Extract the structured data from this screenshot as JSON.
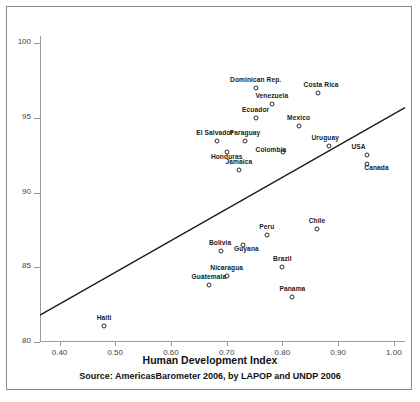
{
  "chart_data": {
    "type": "scatter",
    "title": "",
    "xlabel": "Human Development Index",
    "ylabel": "",
    "xlim": [
      0.365,
      1.02
    ],
    "ylim": [
      80,
      100.5
    ],
    "grid": false,
    "legend": "none",
    "source_note": "Source: AmericasBarometer 2006, by LAPOP and UNDP 2006",
    "x_ticks": [
      "0.40",
      "0.50",
      "0.60",
      "0.70",
      "0.80",
      "0.90",
      "1.00"
    ],
    "x_tick_values": [
      0.4,
      0.5,
      0.6,
      0.7,
      0.8,
      0.9,
      1.0
    ],
    "y_ticks": [
      "80",
      "85",
      "90",
      "95",
      "100"
    ],
    "y_tick_values": [
      80,
      85,
      90,
      95,
      100
    ],
    "fit_line": {
      "x": [
        0.365,
        1.02
      ],
      "y": [
        81.8,
        95.7
      ]
    },
    "points": [
      {
        "label": "Dominican Rep.",
        "x": 0.752,
        "y": 97.0,
        "label_dx": 0,
        "label_dy": -9
      },
      {
        "label": "Costa Rica",
        "x": 0.864,
        "y": 96.7,
        "label_dx": 3,
        "label_dy": -9
      },
      {
        "label": "Venezuela",
        "x": 0.781,
        "y": 95.95,
        "label_dx": 0,
        "label_dy": -9
      },
      {
        "label": "Ecuador",
        "x": 0.752,
        "y": 95.0,
        "label_dx": 0,
        "label_dy": -9
      },
      {
        "label": "Mexico",
        "x": 0.829,
        "y": 94.45,
        "label_dx": 0,
        "label_dy": -9
      },
      {
        "label": "El Salvador",
        "x": 0.682,
        "y": 93.45,
        "label_dx": -2,
        "label_dy": -9
      },
      {
        "label": "Paraguay",
        "x": 0.733,
        "y": 93.45,
        "label_dx": 0,
        "label_dy": -9
      },
      {
        "label": "Uruguay",
        "x": 0.884,
        "y": 93.15,
        "label_dx": -4,
        "label_dy": -9
      },
      {
        "label": "Honduras",
        "x": 0.7,
        "y": 92.75,
        "label_dx": 0,
        "label_dy": 4
      },
      {
        "label": "Colombia",
        "x": 0.801,
        "y": 92.7,
        "label_dx": -12,
        "label_dy": -3
      },
      {
        "label": "USA",
        "x": 0.951,
        "y": 92.55,
        "label_dx": -8,
        "label_dy": -9
      },
      {
        "label": "Canada",
        "x": 0.951,
        "y": 91.95,
        "label_dx": 10,
        "label_dy": 3
      },
      {
        "label": "Jamaica",
        "x": 0.722,
        "y": 91.55,
        "label_dx": 0,
        "label_dy": -9
      },
      {
        "label": "Chile",
        "x": 0.862,
        "y": 87.55,
        "label_dx": 0,
        "label_dy": -9
      },
      {
        "label": "Peru",
        "x": 0.772,
        "y": 87.15,
        "label_dx": 0,
        "label_dy": -9
      },
      {
        "label": "Guyana",
        "x": 0.73,
        "y": 86.5,
        "label_dx": 3,
        "label_dy": 3
      },
      {
        "label": "Bolivia",
        "x": 0.69,
        "y": 86.1,
        "label_dx": -1,
        "label_dy": -9
      },
      {
        "label": "Brazil",
        "x": 0.8,
        "y": 85.0,
        "label_dx": 0,
        "label_dy": -9
      },
      {
        "label": "Nicaragua",
        "x": 0.7,
        "y": 84.45,
        "label_dx": 0,
        "label_dy": -9
      },
      {
        "label": "Guatemala",
        "x": 0.668,
        "y": 83.8,
        "label_dx": 0,
        "label_dy": -9
      },
      {
        "label": "Panama",
        "x": 0.818,
        "y": 83.0,
        "label_dx": 0,
        "label_dy": -9
      },
      {
        "label": "Haiti",
        "x": 0.48,
        "y": 81.05,
        "label_dx": 0,
        "label_dy": -9
      }
    ]
  },
  "axis": {
    "x_title": "Human Development Index"
  },
  "footer": {
    "source": "Source: AmericasBarometer 2006, by LAPOP and UNDP 2006",
    "cut_off_caption": ""
  },
  "colors": {
    "marker_stroke": "#2b2b2b",
    "axis": "#9a9a9a",
    "fit_line": "#1a1a1a",
    "frame": "#8a8a8a",
    "text": "#111111"
  }
}
